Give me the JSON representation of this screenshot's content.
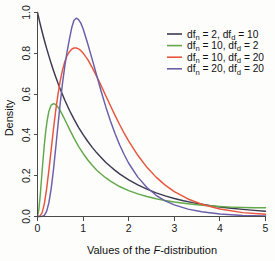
{
  "chart_data": {
    "type": "line",
    "title": "",
    "xlabel": "Values of the F-distribution",
    "xlabel_plain": "Values of the ",
    "xlabel_italic": "F",
    "xlabel_tail": "-distribution",
    "ylabel": "Density",
    "xlim": [
      0,
      5
    ],
    "ylim": [
      0,
      1.02
    ],
    "xticks": [
      "0",
      "1",
      "2",
      "3",
      "4",
      "5"
    ],
    "xtick_values": [
      0,
      1,
      2,
      3,
      4,
      5
    ],
    "yticks": [
      "0.0",
      "0.2",
      "0.4",
      "0.6",
      "0.8",
      "1.0"
    ],
    "ytick_values": [
      0.0,
      0.2,
      0.4,
      0.6,
      0.8,
      1.0
    ],
    "grid": false,
    "legend_position": "top-right",
    "series": [
      {
        "name": "df_n = 2, df_d = 10",
        "label_prefix": "df",
        "label_sub1": "n",
        "label_mid": " = 2, df",
        "label_sub2": "d",
        "label_suffix": " = 10",
        "df_n": 2,
        "df_d": 10,
        "color": "#3c3a52",
        "x": [
          0.0,
          0.05,
          0.1,
          0.15,
          0.2,
          0.25,
          0.3,
          0.35,
          0.4,
          0.45,
          0.5,
          0.6,
          0.7,
          0.8,
          0.9,
          1.0,
          1.1,
          1.2,
          1.3,
          1.4,
          1.5,
          1.6,
          1.7,
          1.8,
          1.9,
          2.0,
          2.2,
          2.4,
          2.6,
          2.8,
          3.0,
          3.2,
          3.4,
          3.6,
          3.8,
          4.0,
          4.25,
          4.5,
          4.75,
          5.0
        ],
        "y": [
          1.0,
          0.952,
          0.907,
          0.864,
          0.824,
          0.786,
          0.75,
          0.716,
          0.684,
          0.653,
          0.624,
          0.57,
          0.521,
          0.477,
          0.437,
          0.401,
          0.369,
          0.339,
          0.312,
          0.288,
          0.265,
          0.245,
          0.226,
          0.209,
          0.194,
          0.18,
          0.155,
          0.134,
          0.116,
          0.101,
          0.088,
          0.077,
          0.068,
          0.06,
          0.053,
          0.047,
          0.04,
          0.035,
          0.03,
          0.026
        ]
      },
      {
        "name": "df_n = 10, df_d = 2",
        "label_prefix": "df",
        "label_sub1": "n",
        "label_mid": " = 10, df",
        "label_sub2": "d",
        "label_suffix": " = 2",
        "df_n": 10,
        "df_d": 2,
        "color": "#63a84a",
        "x": [
          0.0,
          0.03,
          0.06,
          0.09,
          0.12,
          0.15,
          0.18,
          0.21,
          0.25,
          0.3,
          0.35,
          0.4,
          0.45,
          0.5,
          0.55,
          0.6,
          0.7,
          0.8,
          0.9,
          1.0,
          1.1,
          1.2,
          1.3,
          1.4,
          1.5,
          1.6,
          1.8,
          2.0,
          2.2,
          2.4,
          2.6,
          2.8,
          3.0,
          3.25,
          3.5,
          3.75,
          4.0,
          4.25,
          4.5,
          4.75,
          5.0
        ],
        "y": [
          0.0,
          0.035,
          0.105,
          0.19,
          0.275,
          0.352,
          0.417,
          0.468,
          0.516,
          0.546,
          0.553,
          0.549,
          0.536,
          0.518,
          0.497,
          0.474,
          0.428,
          0.384,
          0.344,
          0.309,
          0.278,
          0.251,
          0.227,
          0.207,
          0.189,
          0.173,
          0.147,
          0.127,
          0.111,
          0.098,
          0.087,
          0.078,
          0.071,
          0.064,
          0.058,
          0.053,
          0.049,
          0.046,
          0.044,
          0.043,
          0.043
        ]
      },
      {
        "name": "df_n = 10, df_d = 20",
        "label_prefix": "df",
        "label_sub1": "n",
        "label_mid": " = 10, df",
        "label_sub2": "d",
        "label_suffix": " = 20",
        "df_n": 10,
        "df_d": 20,
        "color": "#e8553c",
        "x": [
          0.0,
          0.05,
          0.1,
          0.15,
          0.2,
          0.25,
          0.3,
          0.35,
          0.4,
          0.45,
          0.5,
          0.55,
          0.6,
          0.65,
          0.7,
          0.75,
          0.8,
          0.85,
          0.9,
          0.95,
          1.0,
          1.1,
          1.2,
          1.3,
          1.4,
          1.5,
          1.6,
          1.7,
          1.8,
          1.9,
          2.0,
          2.2,
          2.4,
          2.6,
          2.8,
          3.0,
          3.3,
          3.6,
          4.0,
          4.5,
          5.0
        ],
        "y": [
          0.0,
          0.002,
          0.018,
          0.062,
          0.135,
          0.227,
          0.328,
          0.428,
          0.52,
          0.6,
          0.667,
          0.72,
          0.76,
          0.789,
          0.808,
          0.82,
          0.826,
          0.826,
          0.822,
          0.813,
          0.801,
          0.77,
          0.73,
          0.686,
          0.639,
          0.591,
          0.543,
          0.496,
          0.451,
          0.409,
          0.37,
          0.3,
          0.241,
          0.193,
          0.154,
          0.122,
          0.086,
          0.06,
          0.037,
          0.019,
          0.011
        ]
      },
      {
        "name": "df_n = 20, df_d = 20",
        "label_prefix": "df",
        "label_sub1": "n",
        "label_mid": " = 20, df",
        "label_sub2": "d",
        "label_suffix": " = 20",
        "df_n": 20,
        "df_d": 20,
        "color": "#6a5fa8",
        "x": [
          0.0,
          0.05,
          0.1,
          0.15,
          0.2,
          0.25,
          0.3,
          0.35,
          0.4,
          0.45,
          0.5,
          0.55,
          0.6,
          0.65,
          0.7,
          0.75,
          0.8,
          0.85,
          0.9,
          0.95,
          1.0,
          1.1,
          1.2,
          1.3,
          1.4,
          1.5,
          1.6,
          1.7,
          1.8,
          1.9,
          2.0,
          2.2,
          2.4,
          2.6,
          2.8,
          3.0,
          3.3,
          3.6,
          4.0,
          4.5,
          5.0
        ],
        "y": [
          0.0,
          0.0,
          0.0005,
          0.006,
          0.025,
          0.068,
          0.137,
          0.229,
          0.337,
          0.45,
          0.558,
          0.656,
          0.74,
          0.81,
          0.87,
          0.925,
          0.962,
          0.972,
          0.965,
          0.948,
          0.92,
          0.848,
          0.77,
          0.69,
          0.61,
          0.536,
          0.468,
          0.407,
          0.352,
          0.304,
          0.261,
          0.193,
          0.142,
          0.104,
          0.077,
          0.057,
          0.036,
          0.023,
          0.012,
          0.005,
          0.002
        ]
      }
    ]
  }
}
